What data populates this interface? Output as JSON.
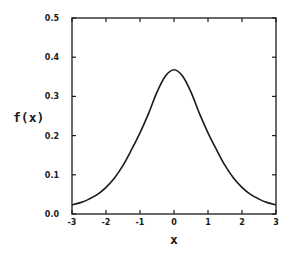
{
  "chart_data": {
    "type": "line",
    "title": "",
    "xlabel": "x",
    "ylabel": "f(x)",
    "xlim": [
      -3,
      3
    ],
    "ylim": [
      0.0,
      0.5
    ],
    "grid": false,
    "legend": null,
    "x_ticks": [
      -3,
      -2,
      -1,
      0,
      1,
      2,
      3
    ],
    "x_tick_labels": [
      "-3",
      "-2",
      "-1",
      "0",
      "1",
      "2",
      "3"
    ],
    "y_ticks": [
      0.0,
      0.1,
      0.2,
      0.3,
      0.4,
      0.5
    ],
    "y_tick_labels": [
      "0.0",
      "0.1",
      "0.2",
      "0.3",
      "0.4",
      "0.5"
    ],
    "series": [
      {
        "name": "f(x)",
        "color": "#1a1a1a",
        "x": [
          -3.0,
          -2.75,
          -2.5,
          -2.25,
          -2.0,
          -1.75,
          -1.5,
          -1.25,
          -1.0,
          -0.75,
          -0.5,
          -0.25,
          0.0,
          0.25,
          0.5,
          0.75,
          1.0,
          1.25,
          1.5,
          1.75,
          2.0,
          2.25,
          2.5,
          2.75,
          3.0
        ],
        "values": [
          0.023,
          0.029,
          0.038,
          0.05,
          0.068,
          0.092,
          0.124,
          0.164,
          0.207,
          0.256,
          0.311,
          0.352,
          0.368,
          0.352,
          0.311,
          0.256,
          0.207,
          0.164,
          0.124,
          0.092,
          0.068,
          0.05,
          0.038,
          0.029,
          0.023
        ]
      }
    ]
  }
}
